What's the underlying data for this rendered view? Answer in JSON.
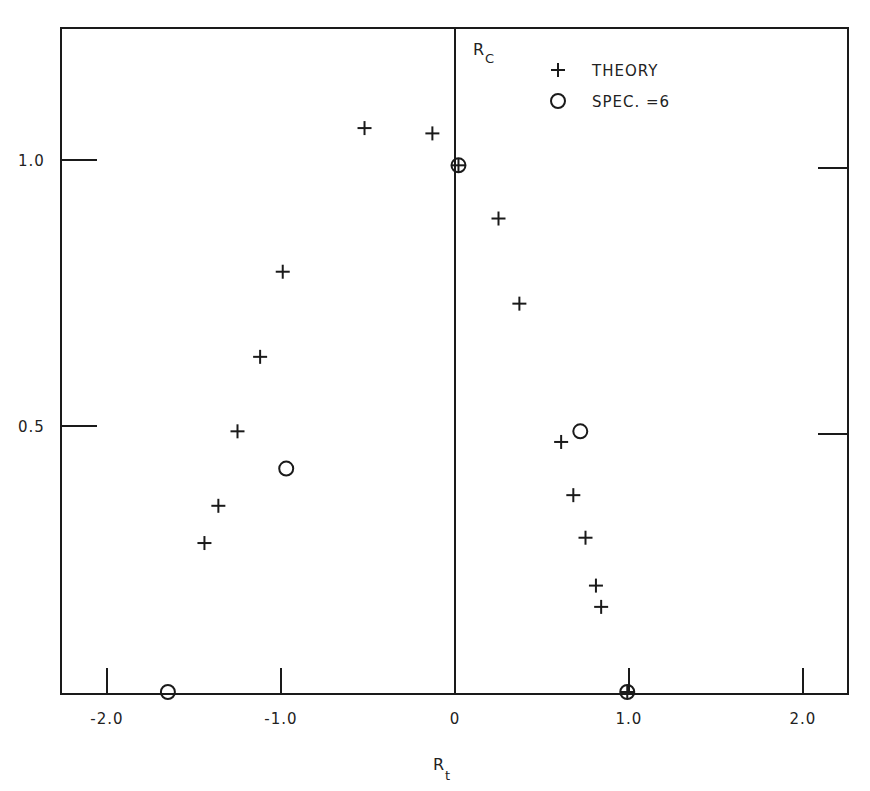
{
  "chart_data": {
    "type": "scatter",
    "title": "",
    "xlabel": "R_t",
    "ylabel": "R_c",
    "xlim": [
      -2.26,
      2.26
    ],
    "ylim": [
      0,
      1.25
    ],
    "grid": false,
    "legend_position": "upper-center-right",
    "x_ticks": [
      {
        "value": -2.0,
        "label": "-2.0"
      },
      {
        "value": -1.0,
        "label": "-1.0"
      },
      {
        "value": 0.0,
        "label": "0"
      },
      {
        "value": 1.0,
        "label": "1.0"
      },
      {
        "value": 2.0,
        "label": "2.0"
      }
    ],
    "y_ticks": [
      {
        "value": 0.5,
        "label": "0.5"
      },
      {
        "value": 1.0,
        "label": "1.0"
      }
    ],
    "series": [
      {
        "name": "THEORY",
        "marker": "plus",
        "points": [
          {
            "x": -0.52,
            "y": 1.06
          },
          {
            "x": -0.13,
            "y": 1.05
          },
          {
            "x": 0.02,
            "y": 0.99
          },
          {
            "x": 0.25,
            "y": 0.89
          },
          {
            "x": 0.37,
            "y": 0.73
          },
          {
            "x": -0.99,
            "y": 0.79
          },
          {
            "x": -1.12,
            "y": 0.63
          },
          {
            "x": -1.25,
            "y": 0.49
          },
          {
            "x": -1.36,
            "y": 0.35
          },
          {
            "x": -1.44,
            "y": 0.28
          },
          {
            "x": 0.61,
            "y": 0.47
          },
          {
            "x": 0.68,
            "y": 0.37
          },
          {
            "x": 0.75,
            "y": 0.29
          },
          {
            "x": 0.81,
            "y": 0.2
          },
          {
            "x": 0.84,
            "y": 0.16
          },
          {
            "x": 0.99,
            "y": 0.0
          }
        ]
      },
      {
        "name": "SPEC. =6",
        "marker": "circle",
        "points": [
          {
            "x": 0.02,
            "y": 0.99
          },
          {
            "x": -0.97,
            "y": 0.42
          },
          {
            "x": 0.72,
            "y": 0.49
          },
          {
            "x": -1.65,
            "y": 0.0
          },
          {
            "x": 0.99,
            "y": 0.0
          }
        ]
      }
    ]
  },
  "axes": {
    "x_label_main": "R",
    "x_label_sub": "t",
    "y_label_main": "R",
    "y_label_sub": "C"
  },
  "legend": {
    "items": [
      {
        "marker": "+",
        "label": "THEORY"
      },
      {
        "marker": "○",
        "label": "SPEC. =6"
      }
    ]
  },
  "colors": {
    "ink": "#1a1a1a",
    "background": "#ffffff"
  }
}
